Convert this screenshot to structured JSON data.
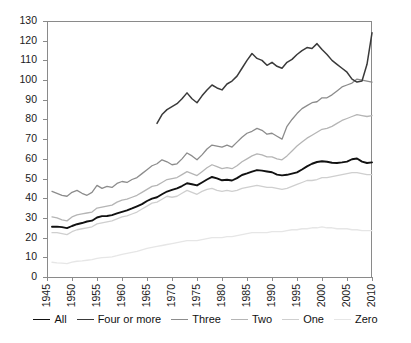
{
  "chart_data": {
    "type": "line",
    "title": "",
    "subtitle": "",
    "xlabel": "",
    "ylabel": "",
    "xlim": [
      1945,
      2010
    ],
    "ylim": [
      0,
      130
    ],
    "grid": false,
    "legend_position": "bottom",
    "y_ticks": [
      0,
      10,
      20,
      30,
      40,
      50,
      60,
      70,
      80,
      90,
      100,
      110,
      120,
      130
    ],
    "x_ticks": [
      1945,
      1950,
      1955,
      1960,
      1965,
      1970,
      1975,
      1980,
      1985,
      1990,
      1995,
      2000,
      2005,
      2010
    ],
    "series": [
      {
        "name": "All",
        "color": "#111111",
        "width": 1.9,
        "x": [
          1946,
          1947,
          1948,
          1949,
          1950,
          1951,
          1952,
          1953,
          1954,
          1955,
          1956,
          1957,
          1958,
          1959,
          1960,
          1961,
          1962,
          1963,
          1964,
          1965,
          1966,
          1967,
          1968,
          1969,
          1970,
          1971,
          1972,
          1973,
          1974,
          1975,
          1976,
          1977,
          1978,
          1979,
          1980,
          1981,
          1982,
          1983,
          1984,
          1985,
          1986,
          1987,
          1988,
          1989,
          1990,
          1991,
          1992,
          1993,
          1994,
          1995,
          1996,
          1997,
          1998,
          1999,
          2000,
          2001,
          2002,
          2003,
          2004,
          2005,
          2006,
          2007,
          2008,
          2009,
          2010
        ],
        "values": [
          25.5,
          25.6,
          25.3,
          24.8,
          25.9,
          26.8,
          27.4,
          28.2,
          28.6,
          30.2,
          30.9,
          31.0,
          31.4,
          32.3,
          33.1,
          33.8,
          34.8,
          35.9,
          37.0,
          38.6,
          39.8,
          40.5,
          42.0,
          43.4,
          44.2,
          45.0,
          46.2,
          47.6,
          47.1,
          46.5,
          48.0,
          49.5,
          50.8,
          50.1,
          49.1,
          49.4,
          49.0,
          50.2,
          51.8,
          52.6,
          53.5,
          54.3,
          54.0,
          53.6,
          53.2,
          52.0,
          51.6,
          51.9,
          52.5,
          53.1,
          54.6,
          56.2,
          57.5,
          58.4,
          58.8,
          58.5,
          58.0,
          57.9,
          58.2,
          58.6,
          59.8,
          60.2,
          58.6,
          57.9,
          58.2
        ]
      },
      {
        "name": "Four or more",
        "color": "#3a3a3a",
        "width": 1.5,
        "x": [
          1967,
          1968,
          1969,
          1970,
          1971,
          1972,
          1973,
          1974,
          1975,
          1976,
          1977,
          1978,
          1979,
          1980,
          1981,
          1982,
          1983,
          1984,
          1985,
          1986,
          1987,
          1988,
          1989,
          1990,
          1991,
          1992,
          1993,
          1994,
          1995,
          1996,
          1997,
          1998,
          1999,
          2000,
          2001,
          2002,
          2003,
          2004,
          2005,
          2006,
          2007,
          2008,
          2009,
          2010
        ],
        "values": [
          78.0,
          82.5,
          85.0,
          86.5,
          88.0,
          90.5,
          93.5,
          90.5,
          88.5,
          92.0,
          95.0,
          97.5,
          96.0,
          95.0,
          98.0,
          99.5,
          102.0,
          106.0,
          110.0,
          113.5,
          111.0,
          110.0,
          107.5,
          109.0,
          107.0,
          106.0,
          109.0,
          110.5,
          113.0,
          115.0,
          116.5,
          116.0,
          118.5,
          115.5,
          113.0,
          110.0,
          108.0,
          106.0,
          104.0,
          100.5,
          99.0,
          99.5,
          108.0,
          124.0
        ]
      },
      {
        "name": "Three",
        "color": "#8c8c8c",
        "width": 1.3,
        "x": [
          1946,
          1947,
          1948,
          1949,
          1950,
          1951,
          1952,
          1953,
          1954,
          1955,
          1956,
          1957,
          1958,
          1959,
          1960,
          1961,
          1962,
          1963,
          1964,
          1965,
          1966,
          1967,
          1968,
          1969,
          1970,
          1971,
          1972,
          1973,
          1974,
          1975,
          1976,
          1977,
          1978,
          1979,
          1980,
          1981,
          1982,
          1983,
          1984,
          1985,
          1986,
          1987,
          1988,
          1989,
          1990,
          1991,
          1992,
          1993,
          1994,
          1995,
          1996,
          1997,
          1998,
          1999,
          2000,
          2001,
          2002,
          2003,
          2004,
          2005,
          2006,
          2007,
          2008,
          2009,
          2010
        ],
        "values": [
          43.5,
          42.5,
          41.5,
          41.0,
          43.0,
          44.0,
          42.5,
          41.5,
          43.0,
          46.5,
          45.0,
          46.0,
          45.5,
          47.5,
          48.5,
          48.0,
          49.5,
          50.5,
          52.5,
          54.5,
          56.5,
          57.5,
          59.5,
          58.5,
          57.0,
          57.5,
          60.0,
          63.0,
          61.5,
          59.5,
          62.0,
          65.0,
          67.0,
          66.5,
          66.0,
          67.0,
          66.0,
          68.5,
          71.0,
          73.0,
          74.0,
          75.5,
          74.5,
          72.5,
          73.0,
          71.5,
          70.0,
          76.5,
          80.0,
          83.0,
          85.5,
          87.0,
          88.5,
          89.0,
          91.0,
          91.0,
          92.5,
          94.5,
          96.5,
          97.5,
          98.5,
          100.5,
          100.0,
          99.5,
          99.0
        ]
      },
      {
        "name": "Two",
        "color": "#b5b5b5",
        "width": 1.3,
        "x": [
          1946,
          1947,
          1948,
          1949,
          1950,
          1951,
          1952,
          1953,
          1954,
          1955,
          1956,
          1957,
          1958,
          1959,
          1960,
          1961,
          1962,
          1963,
          1964,
          1965,
          1966,
          1967,
          1968,
          1969,
          1970,
          1971,
          1972,
          1973,
          1974,
          1975,
          1976,
          1977,
          1978,
          1979,
          1980,
          1981,
          1982,
          1983,
          1984,
          1985,
          1986,
          1987,
          1988,
          1989,
          1990,
          1991,
          1992,
          1993,
          1994,
          1995,
          1996,
          1997,
          1998,
          1999,
          2000,
          2001,
          2002,
          2003,
          2004,
          2005,
          2006,
          2007,
          2008,
          2009,
          2010
        ],
        "values": [
          30.5,
          30.0,
          29.0,
          28.5,
          30.5,
          31.5,
          32.0,
          32.5,
          33.0,
          35.0,
          35.5,
          36.0,
          36.5,
          38.0,
          39.0,
          39.5,
          40.5,
          41.5,
          43.0,
          44.5,
          46.0,
          46.5,
          48.0,
          49.5,
          50.0,
          50.5,
          52.0,
          53.5,
          52.5,
          51.5,
          53.5,
          55.5,
          57.0,
          56.0,
          55.0,
          55.5,
          55.0,
          56.5,
          58.5,
          60.0,
          61.5,
          62.5,
          62.0,
          61.0,
          61.0,
          60.0,
          59.5,
          61.5,
          64.0,
          66.5,
          68.5,
          70.5,
          72.0,
          73.5,
          75.0,
          75.5,
          76.5,
          78.0,
          79.5,
          80.5,
          81.5,
          82.5,
          82.0,
          81.5,
          82.0
        ]
      },
      {
        "name": "One",
        "color": "#cfcfcf",
        "width": 1.3,
        "x": [
          1946,
          1947,
          1948,
          1949,
          1950,
          1951,
          1952,
          1953,
          1954,
          1955,
          1956,
          1957,
          1958,
          1959,
          1960,
          1961,
          1962,
          1963,
          1964,
          1965,
          1966,
          1967,
          1968,
          1969,
          1970,
          1971,
          1972,
          1973,
          1974,
          1975,
          1976,
          1977,
          1978,
          1979,
          1980,
          1981,
          1982,
          1983,
          1984,
          1985,
          1986,
          1987,
          1988,
          1989,
          1990,
          1991,
          1992,
          1993,
          1994,
          1995,
          1996,
          1997,
          1998,
          1999,
          2000,
          2001,
          2002,
          2003,
          2004,
          2005,
          2006,
          2007,
          2008,
          2009,
          2010
        ],
        "values": [
          22.5,
          22.5,
          22.0,
          21.5,
          23.0,
          24.0,
          24.5,
          25.0,
          25.5,
          27.0,
          27.5,
          28.0,
          28.5,
          29.5,
          30.5,
          31.0,
          32.0,
          33.0,
          34.5,
          36.0,
          37.5,
          38.0,
          39.5,
          41.0,
          40.5,
          41.0,
          42.5,
          44.0,
          43.0,
          42.0,
          43.5,
          44.5,
          45.0,
          44.0,
          43.5,
          44.0,
          43.5,
          44.0,
          45.0,
          45.5,
          46.0,
          46.5,
          46.0,
          45.5,
          45.5,
          45.0,
          44.5,
          45.0,
          46.0,
          47.0,
          48.0,
          49.0,
          49.0,
          49.5,
          50.5,
          50.5,
          51.0,
          51.5,
          52.0,
          52.5,
          53.0,
          53.0,
          52.5,
          52.0,
          52.0
        ]
      },
      {
        "name": "Zero",
        "color": "#e6e6e6",
        "width": 1.3,
        "x": [
          1946,
          1947,
          1948,
          1949,
          1950,
          1951,
          1952,
          1953,
          1954,
          1955,
          1956,
          1957,
          1958,
          1959,
          1960,
          1961,
          1962,
          1963,
          1964,
          1965,
          1966,
          1967,
          1968,
          1969,
          1970,
          1971,
          1972,
          1973,
          1974,
          1975,
          1976,
          1977,
          1978,
          1979,
          1980,
          1981,
          1982,
          1983,
          1984,
          1985,
          1986,
          1987,
          1988,
          1989,
          1990,
          1991,
          1992,
          1993,
          1994,
          1995,
          1996,
          1997,
          1998,
          1999,
          2000,
          2001,
          2002,
          2003,
          2004,
          2005,
          2006,
          2007,
          2008,
          2009,
          2010
        ],
        "values": [
          7.5,
          7.2,
          7.0,
          6.8,
          7.5,
          8.0,
          8.2,
          8.5,
          8.8,
          9.5,
          9.8,
          10.0,
          10.2,
          10.8,
          11.5,
          12.0,
          12.5,
          13.0,
          13.8,
          14.5,
          15.0,
          15.5,
          16.0,
          16.5,
          17.0,
          17.5,
          18.0,
          18.5,
          18.5,
          18.5,
          19.0,
          19.5,
          20.0,
          20.0,
          20.0,
          20.5,
          20.5,
          21.0,
          21.5,
          22.0,
          22.5,
          22.5,
          22.5,
          22.5,
          23.0,
          23.0,
          23.0,
          23.5,
          24.0,
          24.0,
          24.5,
          24.5,
          25.0,
          25.0,
          25.5,
          25.0,
          25.0,
          24.5,
          24.5,
          24.5,
          24.0,
          24.0,
          23.5,
          23.5,
          23.5
        ]
      }
    ]
  },
  "axes": {
    "y_tick_labels": [
      "130",
      "120",
      "110",
      "100",
      "90",
      "80",
      "70",
      "60",
      "50",
      "40",
      "30",
      "20",
      "10",
      "0"
    ],
    "x_tick_labels": [
      "1945",
      "1950",
      "1955",
      "1960",
      "1965",
      "1970",
      "1975",
      "1980",
      "1985",
      "1990",
      "1995",
      "2000",
      "2005",
      "2010"
    ]
  },
  "legend": {
    "items": [
      {
        "label": "All",
        "color": "#111111",
        "width": 1.9
      },
      {
        "label": "Four or more",
        "color": "#3a3a3a",
        "width": 1.5
      },
      {
        "label": "Three",
        "color": "#8c8c8c",
        "width": 1.3
      },
      {
        "label": "Two",
        "color": "#b5b5b5",
        "width": 1.3
      },
      {
        "label": "One",
        "color": "#cfcfcf",
        "width": 1.3
      },
      {
        "label": "Zero",
        "color": "#e6e6e6",
        "width": 1.3
      }
    ]
  },
  "style": {
    "axis_color": "#8a8a8a",
    "background": "#ffffff",
    "text_color": "#111111"
  }
}
